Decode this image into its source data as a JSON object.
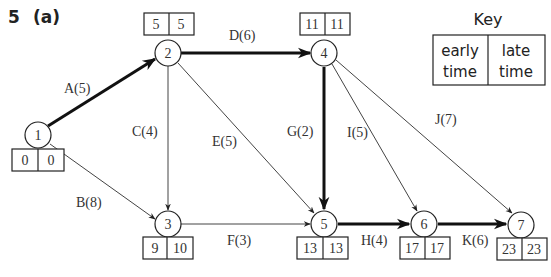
{
  "question": {
    "number": "5",
    "part": "(a)"
  },
  "key": {
    "title": "Key",
    "left": [
      "early",
      "time"
    ],
    "right": [
      "late",
      "time"
    ]
  },
  "nodes": [
    {
      "id": "1",
      "early": "0",
      "late": "0"
    },
    {
      "id": "2",
      "early": "5",
      "late": "5"
    },
    {
      "id": "3",
      "early": "9",
      "late": "10"
    },
    {
      "id": "4",
      "early": "11",
      "late": "11"
    },
    {
      "id": "5",
      "early": "13",
      "late": "13"
    },
    {
      "id": "6",
      "early": "17",
      "late": "17"
    },
    {
      "id": "7",
      "early": "23",
      "late": "23"
    }
  ],
  "activities": [
    {
      "label": "A(5)",
      "from": "1",
      "to": "2",
      "critical": true
    },
    {
      "label": "B(8)",
      "from": "1",
      "to": "3",
      "critical": false
    },
    {
      "label": "C(4)",
      "from": "2",
      "to": "3",
      "critical": false
    },
    {
      "label": "D(6)",
      "from": "2",
      "to": "4",
      "critical": true
    },
    {
      "label": "E(5)",
      "from": "2",
      "to": "5",
      "critical": false
    },
    {
      "label": "F(3)",
      "from": "3",
      "to": "5",
      "critical": false
    },
    {
      "label": "G(2)",
      "from": "4",
      "to": "5",
      "critical": true
    },
    {
      "label": "H(4)",
      "from": "5",
      "to": "6",
      "critical": true
    },
    {
      "label": "I(5)",
      "from": "4",
      "to": "6",
      "critical": false
    },
    {
      "label": "J(7)",
      "from": "4",
      "to": "7",
      "critical": false
    },
    {
      "label": "K(6)",
      "from": "6",
      "to": "7",
      "critical": true
    }
  ],
  "colors": {
    "line": "#333333",
    "critical_line": "#111111",
    "background": "#ffffff"
  }
}
